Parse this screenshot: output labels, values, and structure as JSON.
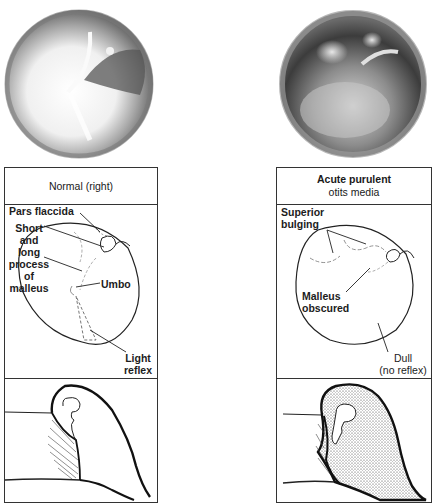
{
  "panels": [
    {
      "id": "normal",
      "title_line1": "Normal (right)",
      "title_line2": "",
      "labels": {
        "pars_flaccida": "Pars flaccida",
        "malleus_line1": "Short",
        "malleus_line2": "and",
        "malleus_line3": "long",
        "malleus_line4": "process",
        "malleus_line5": "of",
        "malleus_line6": "malleus",
        "umbo": "Umbo",
        "light_line1": "Light",
        "light_line2": "reflex"
      }
    },
    {
      "id": "acute-purulent-otitis-media",
      "title_line1": "Acute purulent",
      "title_line2": "otits media",
      "labels": {
        "superior_line1": "Superior",
        "superior_line2": "bulging",
        "malleus_line1": "Malleus",
        "malleus_line2": "obscured",
        "dull_line1": "Dull",
        "dull_line2": "(no reflex)"
      }
    }
  ]
}
